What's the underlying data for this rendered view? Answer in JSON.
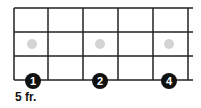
{
  "diagram": {
    "type": "fretboard",
    "fret_label": "5 fr.",
    "strings_y": [
      8,
      32,
      56,
      80
    ],
    "frets_x": [
      14,
      48,
      83,
      118,
      153,
      188
    ],
    "line_end_x": 193,
    "line_color": "#222222",
    "fingers": [
      {
        "number": "1",
        "x": 33,
        "y": 81
      },
      {
        "number": "2",
        "x": 100,
        "y": 81
      },
      {
        "number": "4",
        "x": 169,
        "y": 81
      }
    ],
    "inlay_markers": [
      {
        "x": 32,
        "y": 44
      },
      {
        "x": 100,
        "y": 44
      },
      {
        "x": 169,
        "y": 44
      }
    ],
    "finger_color": "#111111",
    "marker_color": "#d4d4d4"
  }
}
